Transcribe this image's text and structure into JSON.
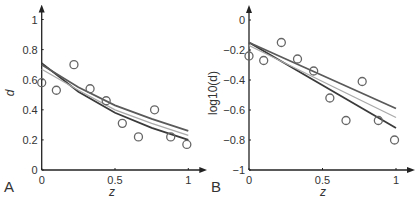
{
  "chart_data": [
    {
      "panel": "A",
      "type": "scatter",
      "xlabel": "z",
      "ylabel": "d",
      "xlim": [
        0,
        1
      ],
      "ylim": [
        0,
        1
      ],
      "xticks": [
        "0",
        "0.5",
        "1"
      ],
      "yticks": [
        "0",
        "0.2",
        "0.4",
        "0.6",
        "0.8",
        "1"
      ],
      "points": {
        "x": [
          0,
          0.1,
          0.22,
          0.33,
          0.44,
          0.55,
          0.66,
          0.77,
          0.88,
          0.99
        ],
        "y": [
          0.58,
          0.53,
          0.7,
          0.54,
          0.46,
          0.31,
          0.22,
          0.4,
          0.22,
          0.17
        ]
      },
      "series": [
        {
          "name": "fit-dark",
          "color": "#3a3a3a",
          "x": [
            0,
            0.25,
            0.5,
            0.75,
            1
          ],
          "y": [
            0.71,
            0.52,
            0.38,
            0.28,
            0.2
          ]
        },
        {
          "name": "fit-medium",
          "color": "#5a5a5a",
          "x": [
            0,
            0.25,
            0.5,
            0.75,
            1
          ],
          "y": [
            0.7,
            0.55,
            0.43,
            0.34,
            0.26
          ]
        },
        {
          "name": "fit-light",
          "color": "#aaaaaa",
          "x": [
            0,
            0.25,
            0.5,
            0.75,
            1
          ],
          "y": [
            0.67,
            0.53,
            0.4,
            0.31,
            0.23
          ]
        }
      ]
    },
    {
      "panel": "B",
      "type": "scatter",
      "xlabel": "z",
      "ylabel": "log10(d)",
      "xlim": [
        0,
        1
      ],
      "ylim": [
        -1,
        0
      ],
      "xticks": [
        "0",
        "0.5",
        "1"
      ],
      "yticks": [
        "−1",
        "−0.8",
        "−0.6",
        "−0.4",
        "−0.2",
        "0"
      ],
      "points": {
        "x": [
          0,
          0.1,
          0.22,
          0.33,
          0.44,
          0.55,
          0.66,
          0.77,
          0.88,
          0.99
        ],
        "y": [
          -0.24,
          -0.27,
          -0.15,
          -0.26,
          -0.34,
          -0.52,
          -0.67,
          -0.41,
          -0.67,
          -0.8
        ]
      },
      "series": [
        {
          "name": "fit-dark",
          "color": "#3a3a3a",
          "x": [
            0,
            1
          ],
          "y": [
            -0.15,
            -0.72
          ]
        },
        {
          "name": "fit-medium",
          "color": "#5a5a5a",
          "x": [
            0,
            1
          ],
          "y": [
            -0.15,
            -0.59
          ]
        },
        {
          "name": "fit-light",
          "color": "#aaaaaa",
          "x": [
            0,
            1
          ],
          "y": [
            -0.17,
            -0.65
          ]
        }
      ]
    }
  ],
  "panels": {
    "a": {
      "label": "A",
      "xlabel": "z",
      "ylabel": "d"
    },
    "b": {
      "label": "B",
      "xlabel": "z",
      "ylabel": "log10(d)"
    }
  }
}
